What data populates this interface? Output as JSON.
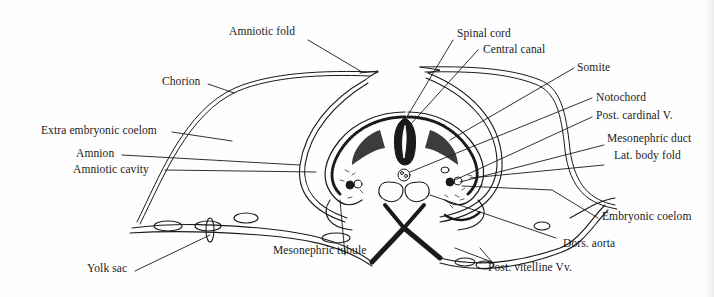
{
  "figure": {
    "colors": {
      "ink": "#1a1a1a",
      "paper": "#fefefe"
    }
  },
  "labels": {
    "amniotic_fold": "Amniotic fold",
    "chorion": "Chorion",
    "extra_embryonic_coelom": "Extra embryonic coelom",
    "amnion": "Amnion",
    "amniotic_cavity": "Amniotic cavity",
    "yolk_sac": "Yolk sac",
    "mesonephric_tubule": "Mesonephric tubule",
    "spinal_cord": "Spinal cord",
    "central_canal": "Central canal",
    "somite": "Somite",
    "notochord": "Notochord",
    "post_cardinal_v": "Post. cardinal V.",
    "mesonephric_duct": "Mesonephric duct",
    "lat_body_fold": "Lat. body fold",
    "embryonic_coelom": "Embryonic coelom",
    "dors_aorta": "Dors. aorta",
    "post_vitelline_vv": "Post. vitelline Vv."
  }
}
